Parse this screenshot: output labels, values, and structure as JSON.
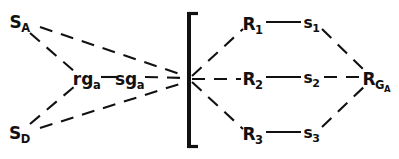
{
  "figure": {
    "type": "node-link-diagram",
    "background_color": "#ffffff",
    "stroke_color": "#111111",
    "width": 399,
    "height": 159,
    "bracket": {
      "name": "left-square-bracket",
      "glyph": "[",
      "x": 189,
      "y_top": 12,
      "y_bottom": 148,
      "serif_length": 9,
      "thickness": 4
    },
    "convergence_point": {
      "x": 189,
      "y": 79
    },
    "nodes": [
      {
        "id": "SA",
        "base": "S",
        "sub": "A",
        "x": 20,
        "y": 22,
        "size": "normal"
      },
      {
        "id": "SD",
        "base": "S",
        "sub": "D",
        "x": 20,
        "y": 133,
        "size": "normal"
      },
      {
        "id": "rga",
        "base": "rg",
        "sub": "a",
        "x": 87,
        "y": 79,
        "size": "normal"
      },
      {
        "id": "sga",
        "base": "sg",
        "sub": "a",
        "x": 130,
        "y": 79,
        "size": "normal"
      },
      {
        "id": "R1",
        "base": "R",
        "sub": "1",
        "x": 253,
        "y": 24,
        "size": "normal"
      },
      {
        "id": "s1",
        "base": "s",
        "sub": "1",
        "x": 312,
        "y": 24,
        "size": "small"
      },
      {
        "id": "R2",
        "base": "R",
        "sub": "2",
        "x": 253,
        "y": 79,
        "size": "normal"
      },
      {
        "id": "s2",
        "base": "s",
        "sub": "2",
        "x": 312,
        "y": 79,
        "size": "small"
      },
      {
        "id": "R3",
        "base": "R",
        "sub": "3",
        "x": 253,
        "y": 134,
        "size": "normal"
      },
      {
        "id": "s3",
        "base": "s",
        "sub": "3",
        "x": 312,
        "y": 134,
        "size": "small"
      },
      {
        "id": "RGA",
        "base": "R",
        "sub": "G",
        "subsub": "A",
        "x": 377,
        "y": 79,
        "size": "normal"
      }
    ],
    "edges": [
      {
        "id": "SA-converge",
        "from": "SA",
        "to": "bracket",
        "style": "dashed",
        "x1": 40,
        "y1": 27,
        "x2": 186,
        "y2": 76
      },
      {
        "id": "SA-rga",
        "from": "SA",
        "to": "rga",
        "style": "dashed",
        "x1": 30,
        "y1": 33,
        "x2": 75,
        "y2": 72
      },
      {
        "id": "SD-converge",
        "from": "SD",
        "to": "bracket",
        "style": "dashed",
        "x1": 40,
        "y1": 128,
        "x2": 186,
        "y2": 82
      },
      {
        "id": "SD-rga",
        "from": "SD",
        "to": "rga",
        "style": "dashed",
        "x1": 30,
        "y1": 124,
        "x2": 75,
        "y2": 86
      },
      {
        "id": "rga-sga",
        "from": "rga",
        "to": "sga",
        "style": "solid",
        "x1": 101,
        "y1": 77,
        "x2": 117,
        "y2": 77
      },
      {
        "id": "sga-converge",
        "from": "sga",
        "to": "bracket",
        "style": "dashed",
        "x1": 145,
        "y1": 77,
        "x2": 186,
        "y2": 78
      },
      {
        "id": "bracket-R1",
        "from": "bracket",
        "to": "R1",
        "style": "dashed",
        "x1": 192,
        "y1": 76,
        "x2": 243,
        "y2": 29
      },
      {
        "id": "bracket-R2",
        "from": "bracket",
        "to": "R2",
        "style": "dashed",
        "x1": 192,
        "y1": 79,
        "x2": 241,
        "y2": 79
      },
      {
        "id": "bracket-R3",
        "from": "bracket",
        "to": "R3",
        "style": "dashed",
        "x1": 192,
        "y1": 82,
        "x2": 243,
        "y2": 129
      },
      {
        "id": "R1-s1",
        "from": "R1",
        "to": "s1",
        "style": "solid",
        "x1": 266,
        "y1": 22,
        "x2": 301,
        "y2": 22
      },
      {
        "id": "R2-s2",
        "from": "R2",
        "to": "s2",
        "style": "solid",
        "x1": 266,
        "y1": 77,
        "x2": 301,
        "y2": 77
      },
      {
        "id": "R3-s3",
        "from": "R3",
        "to": "s3",
        "style": "solid",
        "x1": 266,
        "y1": 132,
        "x2": 301,
        "y2": 132
      },
      {
        "id": "s1-RGA",
        "from": "s1",
        "to": "RGA",
        "style": "dashed",
        "x1": 322,
        "y1": 29,
        "x2": 367,
        "y2": 73
      },
      {
        "id": "s2-RGA",
        "from": "s2",
        "to": "RGA",
        "style": "dashed",
        "x1": 324,
        "y1": 77,
        "x2": 365,
        "y2": 77
      },
      {
        "id": "s3-RGA",
        "from": "s3",
        "to": "RGA",
        "style": "dashed",
        "x1": 322,
        "y1": 127,
        "x2": 367,
        "y2": 84
      }
    ]
  }
}
